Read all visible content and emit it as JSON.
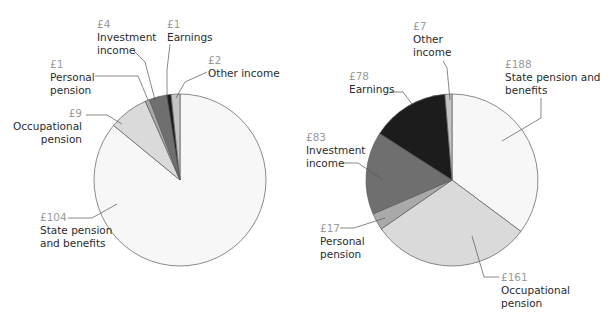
{
  "chart_data": [
    {
      "type": "pie",
      "title": "",
      "currency": "£",
      "center": [
        180,
        180
      ],
      "radius": 86,
      "start_angle_deg": 0,
      "direction": "clockwise",
      "categories": [
        "State pension and benefits",
        "Occupational pension",
        "Personal pension",
        "Investment income",
        "Earnings",
        "Other income"
      ],
      "values": [
        104,
        9,
        1,
        4,
        1,
        2
      ],
      "colors": [
        "#f7f7f7",
        "#dadada",
        "#a9a9a9",
        "#6f6f6f",
        "#1c1c1c",
        "#c4c4c4"
      ],
      "labels": [
        {
          "value": "£104",
          "name_lines": [
            "State pension",
            "and benefits"
          ],
          "x": 40,
          "y": 211,
          "align": "left",
          "leader": [
            [
              68,
              218
            ],
            [
              92,
              218
            ],
            [
              117,
              204
            ]
          ]
        },
        {
          "value": "£9",
          "name_lines": [
            "Occupational",
            "pension"
          ],
          "x": 4,
          "y": 107,
          "align": "right",
          "w": 78,
          "leader": [
            [
              86,
              115
            ],
            [
              107,
              115
            ],
            [
              122,
              124
            ]
          ]
        },
        {
          "value": "£1",
          "name_lines": [
            "Personal",
            "pension"
          ],
          "x": 50,
          "y": 58,
          "align": "left",
          "leader": [
            [
              95,
              76
            ],
            [
              138,
              76
            ],
            [
              148,
              100
            ]
          ]
        },
        {
          "value": "£4",
          "name_lines": [
            "Investment",
            "income"
          ],
          "x": 97,
          "y": 18,
          "align": "left",
          "leader": [
            [
              133,
              50
            ],
            [
              145,
              62
            ],
            [
              155,
              100
            ]
          ]
        },
        {
          "value": "£1",
          "name_lines": [
            "Earnings"
          ],
          "x": 167,
          "y": 18,
          "align": "left",
          "leader": [
            [
              170,
              44
            ],
            [
              167,
              70
            ],
            [
              167,
              97
            ]
          ]
        },
        {
          "value": "£2",
          "name_lines": [
            "Other income"
          ],
          "x": 208,
          "y": 54,
          "align": "left",
          "leader": [
            [
              207,
              72
            ],
            [
              185,
              82
            ],
            [
              176,
              98
            ]
          ]
        }
      ]
    },
    {
      "type": "pie",
      "title": "",
      "currency": "£",
      "center": [
        452,
        180
      ],
      "radius": 86,
      "start_angle_deg": 0,
      "direction": "clockwise",
      "categories": [
        "State pension and benefits",
        "Occupational pension",
        "Personal pension",
        "Investment income",
        "Earnings",
        "Other income"
      ],
      "values": [
        188,
        161,
        17,
        83,
        78,
        7
      ],
      "colors": [
        "#f7f7f7",
        "#dadada",
        "#a9a9a9",
        "#6f6f6f",
        "#1c1c1c",
        "#c4c4c4"
      ],
      "labels": [
        {
          "value": "£188",
          "name_lines": [
            "State pension and",
            "benefits"
          ],
          "x": 505,
          "y": 58,
          "align": "left",
          "leader": [
            [
              541,
              98
            ],
            [
              541,
              118
            ],
            [
              502,
              141
            ]
          ]
        },
        {
          "value": "£161",
          "name_lines": [
            "Occupational",
            "pension"
          ],
          "x": 501,
          "y": 271,
          "align": "left",
          "leader": [
            [
              499,
              277
            ],
            [
              484,
              277
            ],
            [
              472,
              236
            ]
          ]
        },
        {
          "value": "£17",
          "name_lines": [
            "Personal",
            "pension"
          ],
          "x": 320,
          "y": 222,
          "align": "left",
          "leader": [
            [
              340,
              228
            ],
            [
              354,
              228
            ],
            [
              385,
              218
            ]
          ]
        },
        {
          "value": "£83",
          "name_lines": [
            "Investment",
            "income"
          ],
          "x": 306,
          "y": 131,
          "align": "left",
          "leader": [
            [
              343,
              163
            ],
            [
              358,
              163
            ],
            [
              383,
              180
            ]
          ]
        },
        {
          "value": "£78",
          "name_lines": [
            "Earnings"
          ],
          "x": 349,
          "y": 70,
          "align": "left",
          "leader": [
            [
              390,
              92
            ],
            [
              403,
              92
            ],
            [
              412,
              104
            ]
          ]
        },
        {
          "value": "£7",
          "name_lines": [
            "Other",
            "income"
          ],
          "x": 413,
          "y": 20,
          "align": "left",
          "leader": [
            [
              443,
              61
            ],
            [
              447,
              68
            ],
            [
              450,
              100
            ]
          ]
        }
      ]
    }
  ]
}
